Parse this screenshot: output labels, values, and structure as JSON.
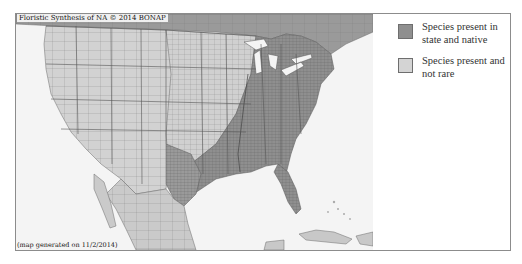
{
  "map": {
    "credit": "Floristic Synthesis of NA © 2014 BONAP",
    "generated": "(map generated on 11/2/2014)",
    "colors": {
      "water": "#f4f4f4",
      "not_present": "#d2d2d2",
      "native": "#8f8f8f",
      "canada": "#9a9a9a",
      "border": "#6a6a6a"
    }
  },
  "legend": {
    "items": [
      {
        "label": "Species present in state and native",
        "color": "#8f8f8f"
      },
      {
        "label": "Species present and not rare",
        "color": "#d4d4d4"
      }
    ]
  }
}
